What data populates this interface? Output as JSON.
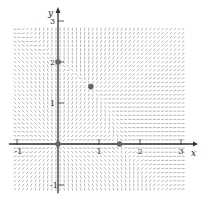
{
  "chart_data": {
    "type": "direction_field",
    "title": "",
    "xlabel": "x",
    "ylabel": "y",
    "xlim": [
      -1.1,
      3.2
    ],
    "ylim": [
      -1.15,
      2.9
    ],
    "x_ticks": [
      -1,
      1,
      2,
      3
    ],
    "x_tick_labels": [
      "-1",
      "1",
      "2",
      "3"
    ],
    "y_ticks": [
      -1,
      1,
      2,
      3
    ],
    "y_tick_labels": [
      "-1",
      "1",
      "2",
      "3"
    ],
    "grid": false,
    "system": {
      "dx_dt": "x(1.5 - x - 0.5y)",
      "dy_dt": "y(2 - y - 0.75x)"
    },
    "equilibrium_points": [
      {
        "x": 0,
        "y": 0
      },
      {
        "x": 0,
        "y": 2
      },
      {
        "x": 0.8,
        "y": 1.4
      },
      {
        "x": 1.5,
        "y": 0
      }
    ],
    "field_grid_step": 0.1,
    "colors": {
      "field": "#9a9a9a",
      "axis": "#333333",
      "point": "#666666"
    }
  },
  "layout": {
    "origin_px": [
      58,
      144
    ],
    "unit_px": 41
  }
}
